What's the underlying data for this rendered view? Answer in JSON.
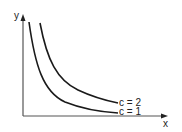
{
  "diagram": {
    "type": "level-curves",
    "axes": {
      "x_label": "x",
      "y_label": "y"
    },
    "curves": [
      {
        "label": "c = 2",
        "c": 2
      },
      {
        "label": "c = 1",
        "c": 1
      }
    ],
    "colors": {
      "curve": "#1a1a1a",
      "axis": "#555555",
      "background": "#ffffff"
    }
  }
}
